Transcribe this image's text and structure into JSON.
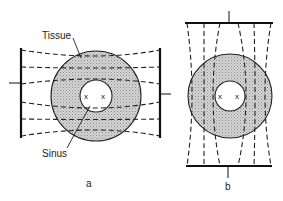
{
  "figure": {
    "labels": {
      "tissue": "Tissue",
      "sinus": "Sinus"
    },
    "panels": [
      {
        "id": "a",
        "label": "a",
        "electrode_orientation": "vertical (left and right)",
        "field_lines": 6,
        "markers": [
          "x",
          "x"
        ]
      },
      {
        "id": "b",
        "label": "b",
        "electrode_orientation": "horizontal (top and bottom)",
        "field_lines": 6,
        "markers": [
          "x",
          "x"
        ]
      }
    ],
    "colors": {
      "line": "#222222",
      "tissue_fill": "#cfcfcf",
      "sinus_fill": "#ffffff",
      "background": "#ffffff"
    }
  }
}
